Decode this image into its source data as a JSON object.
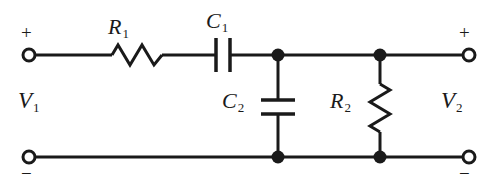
{
  "figure": {
    "background_color": "#ffffff",
    "line_color": "#1a1a1a"
  },
  "labels": {
    "r1": "R",
    "r1_sub": "1",
    "c1": "C",
    "c1_sub": "1",
    "c2": "C",
    "c2_sub": "2",
    "r2": "R",
    "r2_sub": "2",
    "v1": "V",
    "v1_sub": "1",
    "v2": "V",
    "v2_sub": "2"
  },
  "polarity": {
    "input_plus": "+",
    "input_minus": "−",
    "output_plus": "+",
    "output_minus": "−"
  },
  "circuit": {
    "type": "schematic",
    "components": [
      {
        "id": "R1",
        "kind": "resistor",
        "label": "R1",
        "orientation": "horizontal",
        "branch": "series-top"
      },
      {
        "id": "C1",
        "kind": "capacitor",
        "label": "C1",
        "orientation": "horizontal",
        "branch": "series-top"
      },
      {
        "id": "C2",
        "kind": "capacitor",
        "label": "C2",
        "orientation": "vertical",
        "branch": "shunt"
      },
      {
        "id": "R2",
        "kind": "resistor",
        "label": "R2",
        "orientation": "vertical",
        "branch": "shunt"
      }
    ],
    "terminals": [
      {
        "id": "in-plus",
        "label": "+",
        "position": "top-left"
      },
      {
        "id": "in-minus",
        "label": "−",
        "position": "bottom-left"
      },
      {
        "id": "out-plus",
        "label": "+",
        "position": "top-right"
      },
      {
        "id": "out-minus",
        "label": "−",
        "position": "bottom-right"
      }
    ],
    "junction_nodes": 4
  }
}
